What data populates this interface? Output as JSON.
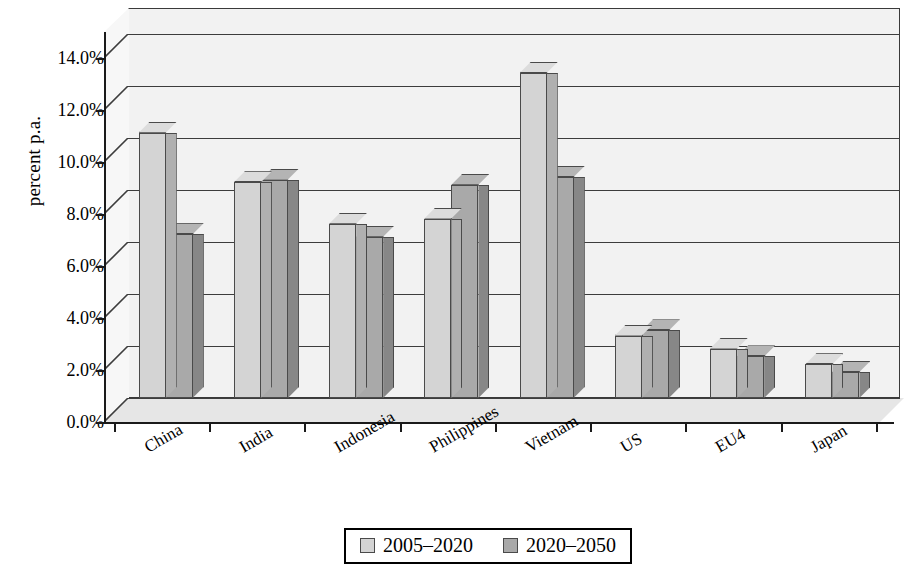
{
  "chart_data": {
    "type": "bar",
    "title": "",
    "subtitle": "",
    "xlabel": "",
    "ylabel": "percent p.a.",
    "ylim": [
      0,
      15
    ],
    "ytick_values": [
      0,
      2,
      4,
      6,
      8,
      10,
      12,
      14
    ],
    "ytick_labels": [
      "0.0%",
      "2.0%",
      "4.0%",
      "6.0%",
      "8.0%",
      "10.0%",
      "12.0%",
      "14.0%"
    ],
    "grid": true,
    "legend_position": "bottom",
    "style": "3d-grouped-bar",
    "categories": [
      "China",
      "India",
      "Indonesia",
      "Philippines",
      "Vietnam",
      "US",
      "EU4",
      "Japan"
    ],
    "series": [
      {
        "name": "2005–2020",
        "color": "#d4d4d4",
        "values": [
          10.2,
          8.3,
          6.7,
          6.9,
          12.5,
          2.4,
          1.9,
          1.3
        ]
      },
      {
        "name": "2020–2050",
        "color": "#a9a9a9",
        "values": [
          6.3,
          8.4,
          6.2,
          8.2,
          8.5,
          2.6,
          1.6,
          1.0
        ]
      }
    ],
    "colors": {
      "series1": "#d4d4d4",
      "series2": "#a9a9a9",
      "axis": "#1a1a1a",
      "gridline": "#3d3d3d",
      "plot_background": "#f2f2f2",
      "floor": "#e6e6e6",
      "page_background": "#ffffff"
    }
  },
  "axis": {
    "y_title": "percent p.a."
  },
  "legend": {
    "entries": [
      {
        "label": "2005–2020",
        "swatch": "light-grey-swatch"
      },
      {
        "label": "2020–2050",
        "swatch": "medium-grey-swatch"
      }
    ]
  }
}
